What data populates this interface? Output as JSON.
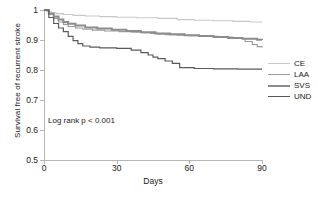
{
  "chart_data": {
    "type": "line",
    "title": "",
    "xlabel": "Days",
    "ylabel": "Survival free of recurrent stroke",
    "xlim": [
      0,
      90
    ],
    "ylim": [
      0.5,
      1.0
    ],
    "xticks": [
      0,
      30,
      60,
      90
    ],
    "xtick_labels": [
      "0",
      "30",
      "60",
      "90"
    ],
    "yticks": [
      0.5,
      0.6,
      0.7,
      0.8,
      0.9,
      1.0
    ],
    "ytick_labels": [
      "0.5",
      "0.6",
      "0.7",
      "0.8",
      "0.9",
      "1"
    ],
    "grid": false,
    "legend_position": "right",
    "annotation": "Log rank p < 0.001",
    "series": [
      {
        "name": "CE",
        "color": "#c8c8c8",
        "width": 1.1,
        "x": [
          0,
          1,
          3,
          5,
          8,
          12,
          17,
          23,
          30,
          38,
          47,
          55,
          62,
          70,
          78,
          85,
          90
        ],
        "y": [
          1.0,
          0.995,
          0.991,
          0.988,
          0.985,
          0.982,
          0.98,
          0.978,
          0.976,
          0.974,
          0.972,
          0.968,
          0.966,
          0.964,
          0.962,
          0.96,
          0.96
        ]
      },
      {
        "name": "LAA",
        "color": "#9a9a9a",
        "width": 1.1,
        "x": [
          0,
          2,
          4,
          6,
          8,
          10,
          13,
          16,
          20,
          25,
          31,
          36,
          41,
          44,
          47,
          50,
          55,
          60,
          66,
          72,
          78,
          83,
          86,
          88,
          90
        ],
        "y": [
          1.0,
          0.985,
          0.972,
          0.96,
          0.952,
          0.945,
          0.94,
          0.936,
          0.933,
          0.93,
          0.928,
          0.926,
          0.924,
          0.922,
          0.92,
          0.918,
          0.916,
          0.914,
          0.912,
          0.91,
          0.905,
          0.895,
          0.885,
          0.878,
          0.875
        ]
      },
      {
        "name": "SVS",
        "color": "#8c8c8c",
        "width": 2.0,
        "x": [
          0,
          2,
          4,
          6,
          8,
          10,
          13,
          17,
          22,
          28,
          34,
          40,
          46,
          52,
          58,
          64,
          70,
          76,
          82,
          88,
          90
        ],
        "y": [
          1.0,
          0.988,
          0.978,
          0.968,
          0.96,
          0.954,
          0.948,
          0.942,
          0.938,
          0.934,
          0.93,
          0.926,
          0.922,
          0.919,
          0.916,
          0.913,
          0.91,
          0.907,
          0.904,
          0.901,
          0.9
        ]
      },
      {
        "name": "UND",
        "color": "#5a5a5a",
        "width": 1.2,
        "x": [
          0,
          2,
          4,
          6,
          8,
          10,
          12,
          14,
          16,
          19,
          23,
          30,
          36,
          40,
          43,
          45,
          47,
          50,
          53,
          56,
          62,
          70,
          80,
          90
        ],
        "y": [
          1.0,
          0.975,
          0.955,
          0.94,
          0.928,
          0.912,
          0.898,
          0.888,
          0.88,
          0.876,
          0.874,
          0.872,
          0.866,
          0.858,
          0.85,
          0.843,
          0.838,
          0.83,
          0.822,
          0.808,
          0.805,
          0.804,
          0.803,
          0.803
        ]
      }
    ]
  },
  "figure": {
    "xaxis_title": "Days",
    "yaxis_title": "Survival free of recurrent stroke",
    "annotation": "Log rank p < 0.001"
  },
  "legend": {
    "items": [
      {
        "label": "CE"
      },
      {
        "label": "LAA"
      },
      {
        "label": "SVS"
      },
      {
        "label": "UND"
      }
    ]
  }
}
